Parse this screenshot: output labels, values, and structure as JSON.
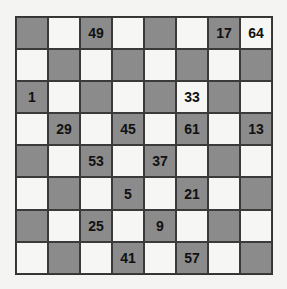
{
  "puzzle": {
    "type": "number-checkerboard",
    "rows": 8,
    "cols": 8,
    "colors": {
      "dark_square": "#a8a8a8",
      "light_square": "#f6f6f4",
      "grid_line": "#333333",
      "number": "#111111"
    },
    "cells": [
      [
        "",
        "",
        "49",
        "",
        "",
        "",
        "17",
        "64"
      ],
      [
        "",
        "",
        "",
        "",
        "",
        "",
        "",
        ""
      ],
      [
        "1",
        "",
        "",
        "",
        "",
        "33",
        "",
        ""
      ],
      [
        "",
        "29",
        "",
        "45",
        "",
        "61",
        "",
        "13"
      ],
      [
        "",
        "",
        "53",
        "",
        "37",
        "",
        "",
        ""
      ],
      [
        "",
        "",
        "",
        "5",
        "",
        "21",
        "",
        ""
      ],
      [
        "",
        "",
        "25",
        "",
        "9",
        "",
        "",
        ""
      ],
      [
        "",
        "",
        "",
        "41",
        "",
        "57",
        "",
        ""
      ]
    ]
  }
}
